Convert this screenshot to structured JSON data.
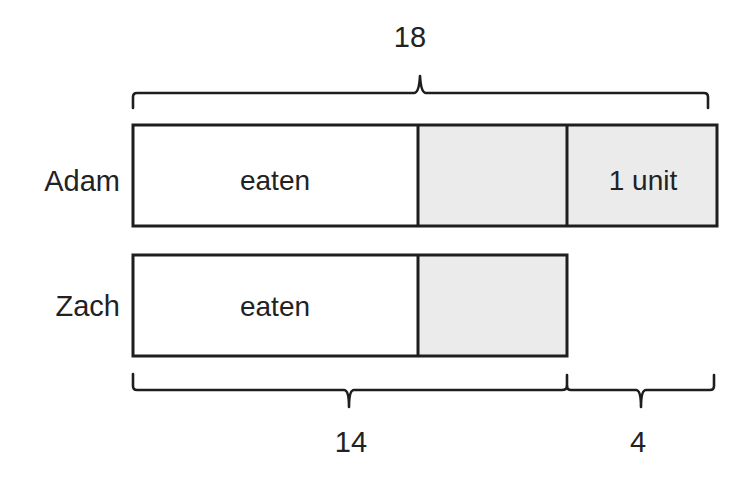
{
  "diagram": {
    "type": "tape-diagram",
    "colors": {
      "stroke": "#1e1e1e",
      "text": "#222222",
      "empty_fill": "#ffffff",
      "shaded_fill": "#ebebeb"
    },
    "top_brace": {
      "label": "18",
      "spans": "Adam full bar"
    },
    "rows": [
      {
        "name": "Adam",
        "segments": [
          {
            "label": "eaten",
            "shaded": false
          },
          {
            "label": "",
            "shaded": true
          },
          {
            "label": "1 unit",
            "shaded": true
          }
        ]
      },
      {
        "name": "Zach",
        "segments": [
          {
            "label": "eaten",
            "shaded": false
          },
          {
            "label": "",
            "shaded": true
          }
        ]
      }
    ],
    "bottom_braces": [
      {
        "label": "14",
        "spans": "Zach full bar"
      },
      {
        "label": "4",
        "spans": "difference (Adam's last unit)"
      }
    ]
  }
}
